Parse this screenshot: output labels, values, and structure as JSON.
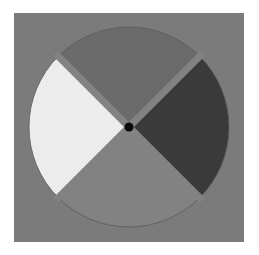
{
  "figure": {
    "canvas": {
      "width": 259,
      "height": 255,
      "background": "#ffffff"
    },
    "square": {
      "x": 14,
      "y": 13,
      "width": 230,
      "height": 229,
      "color": "#7b7b7b"
    },
    "disk": {
      "cx": 129,
      "cy": 127,
      "r": 100,
      "gap_width": 7,
      "gap_color": "#828282",
      "outline_color": "#5a5a5a",
      "quadrants": [
        {
          "name": "top",
          "start_deg": -135,
          "end_deg": -45,
          "color": "#6b6b6b"
        },
        {
          "name": "right",
          "start_deg": -45,
          "end_deg": 45,
          "color": "#3a3a3a"
        },
        {
          "name": "bottom",
          "start_deg": 45,
          "end_deg": 135,
          "color": "#828282"
        },
        {
          "name": "left",
          "start_deg": 135,
          "end_deg": 225,
          "color": "#ececec"
        }
      ]
    },
    "center_dot": {
      "r": 4.5,
      "color": "#0a0a0a"
    }
  }
}
